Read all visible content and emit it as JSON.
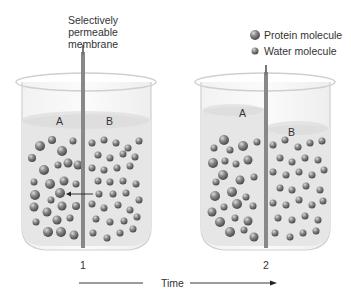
{
  "membrane_label": [
    "Selectively",
    "permeable",
    "membrane"
  ],
  "legend": [
    {
      "label": "Protein molecule",
      "icon": "large-sphere"
    },
    {
      "label": "Water molecule",
      "icon": "small-sphere"
    }
  ],
  "beakers": [
    {
      "number": "1",
      "side_a": "A",
      "side_b": "B"
    },
    {
      "number": "2",
      "side_a": "A",
      "side_b": "B"
    }
  ],
  "time_label": "Time",
  "colors": {
    "sphere": "#7a7a7a",
    "membrane": "#888888",
    "liquid": "#e4e4e4"
  }
}
